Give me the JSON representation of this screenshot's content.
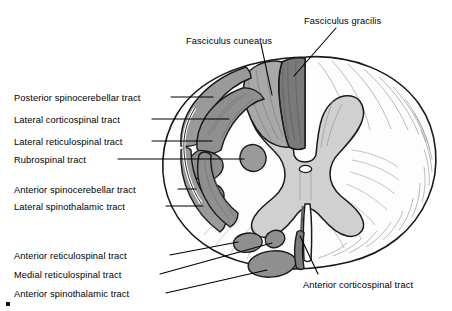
{
  "figure": {
    "colors": {
      "background": "#ffffff",
      "outline": "#1a1a1a",
      "white_matter": "#fdfdfd",
      "gray_matter": "#d0d0d0",
      "tract_light": "#9a9a9a",
      "tract_dark": "#7c7c7c",
      "fasciculus_gracilis": "#7a7a7a",
      "fasciculus_cuneatus": "#a8a8a8",
      "leader_line": "#000000",
      "text": "#000000"
    }
  },
  "labels": {
    "fasciculus_gracilis": "Fasciculus gracilis",
    "fasciculus_cuneatus": "Fasciculus cuneatus",
    "posterior_spinocerebellar": "Posterior spinocerebellar tract",
    "lateral_corticospinal": "Lateral corticospinal tract",
    "lateral_reticulospinal": "Lateral reticulospinal tract",
    "rubrospinal": "Rubrospinal tract",
    "anterior_spinocerebellar": "Anterior spinocerebellar tract",
    "lateral_spinothalamic": "Lateral spinothalamic tract",
    "anterior_reticulospinal": "Anterior reticulospinal tract",
    "medial_reticulospinal": "Medial reticulospinal tract",
    "anterior_spinothalamic": "Anterior spinothalamic tract",
    "anterior_corticospinal": "Anterior corticospinal tract"
  },
  "label_positions": {
    "fasciculus_gracilis": {
      "x": 304,
      "y": 16,
      "align": "left"
    },
    "fasciculus_cuneatus": {
      "x": 186,
      "y": 36,
      "align": "left"
    },
    "posterior_spinocerebellar": {
      "x": 14,
      "y": 93,
      "align": "left"
    },
    "lateral_corticospinal": {
      "x": 14,
      "y": 115,
      "align": "left"
    },
    "lateral_reticulospinal": {
      "x": 14,
      "y": 137,
      "align": "left"
    },
    "rubrospinal": {
      "x": 14,
      "y": 155,
      "align": "left"
    },
    "anterior_spinocerebellar": {
      "x": 14,
      "y": 185,
      "align": "left"
    },
    "lateral_spinothalamic": {
      "x": 14,
      "y": 202,
      "align": "left"
    },
    "anterior_reticulospinal": {
      "x": 14,
      "y": 251,
      "align": "left"
    },
    "medial_reticulospinal": {
      "x": 14,
      "y": 270,
      "align": "left"
    },
    "anterior_spinothalamic": {
      "x": 14,
      "y": 289,
      "align": "left"
    },
    "anterior_corticospinal": {
      "x": 303,
      "y": 280,
      "align": "left"
    }
  }
}
